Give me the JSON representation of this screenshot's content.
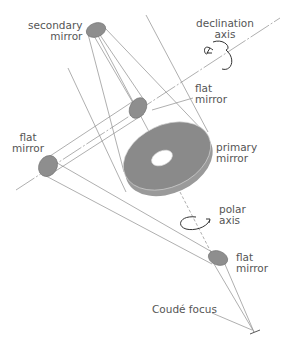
{
  "colors": {
    "background": "#ffffff",
    "line": "#8c8c8c",
    "mirror_fill": "#8e8e8e",
    "mirror_edge": "#6f6f6f",
    "primary_fill": "#8a8a8a",
    "primary_side": "#9a9a9a",
    "text": "#555555",
    "arrow": "#333333"
  },
  "labels": {
    "secondary_mirror": "secondary\nmirror",
    "declination_axis": "declination\naxis",
    "flat_mirror_upper": "flat\nmirror",
    "flat_mirror_left": "flat\nmirror",
    "primary_mirror": "primary\nmirror",
    "polar_axis": "polar\naxis",
    "flat_mirror_lower": "flat\nmirror",
    "coude_focus": "Coudé focus"
  },
  "components": [
    {
      "id": "secondary-mirror",
      "label": "secondary mirror"
    },
    {
      "id": "flat-mirror-upper",
      "label": "flat mirror"
    },
    {
      "id": "flat-mirror-left",
      "label": "flat mirror"
    },
    {
      "id": "primary-mirror",
      "label": "primary mirror"
    },
    {
      "id": "flat-mirror-lower",
      "label": "flat mirror"
    },
    {
      "id": "coude-focus",
      "label": "Coudé focus"
    }
  ],
  "axes": [
    {
      "id": "declination-axis",
      "label": "declination axis"
    },
    {
      "id": "polar-axis",
      "label": "polar axis"
    }
  ]
}
